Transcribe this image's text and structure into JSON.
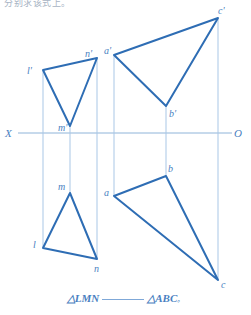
{
  "header": {
    "note": "分别求该式上。"
  },
  "axis": {
    "x_label": "X",
    "o_label": "O",
    "line_color": "#8fb4d9",
    "y": 133,
    "x_start": 18,
    "x_end": 232
  },
  "colors": {
    "stroke": "#2e6db4",
    "thin": "#a9c7e6",
    "label": "#4a7fc1",
    "background": "#ffffff"
  },
  "projectors": [
    {
      "name": "projector-l",
      "x": 43,
      "y1": 70,
      "y2": 248
    },
    {
      "name": "projector-m",
      "x": 70,
      "y1": 126,
      "y2": 193
    },
    {
      "name": "projector-n",
      "x": 97,
      "y1": 58,
      "y2": 259
    },
    {
      "name": "projector-a",
      "x": 114,
      "y1": 55,
      "y2": 196
    },
    {
      "name": "projector-b",
      "x": 166,
      "y1": 106,
      "y2": 176
    },
    {
      "name": "projector-c",
      "x": 218,
      "y1": 18,
      "y2": 280
    }
  ],
  "chart_data": {
    "type": "diagram",
    "triangles": [
      {
        "id": "lmn-front",
        "name": "l'm'n'",
        "points": [
          [
            43,
            70
          ],
          [
            70,
            126
          ],
          [
            97,
            58
          ]
        ],
        "labels": [
          {
            "text": "l'",
            "x": 27,
            "y": 74
          },
          {
            "text": "m'",
            "x": 58,
            "y": 131
          },
          {
            "text": "n'",
            "x": 85,
            "y": 57
          }
        ]
      },
      {
        "id": "lmn-top",
        "name": "lmn",
        "points": [
          [
            43,
            248
          ],
          [
            70,
            193
          ],
          [
            97,
            259
          ]
        ],
        "labels": [
          {
            "text": "l",
            "x": 33,
            "y": 248
          },
          {
            "text": "m",
            "x": 58,
            "y": 190
          },
          {
            "text": "n",
            "x": 94,
            "y": 272
          }
        ]
      },
      {
        "id": "abc-front",
        "name": "a'b'c'",
        "points": [
          [
            114,
            55
          ],
          [
            166,
            106
          ],
          [
            218,
            18
          ]
        ],
        "labels": [
          {
            "text": "a'",
            "x": 104,
            "y": 54
          },
          {
            "text": "b'",
            "x": 169,
            "y": 117
          },
          {
            "text": "c'",
            "x": 218,
            "y": 14
          }
        ]
      },
      {
        "id": "abc-top",
        "name": "abc",
        "points": [
          [
            114,
            196
          ],
          [
            166,
            176
          ],
          [
            218,
            280
          ]
        ],
        "labels": [
          {
            "text": "a",
            "x": 104,
            "y": 196
          },
          {
            "text": "b",
            "x": 168,
            "y": 172
          },
          {
            "text": "c",
            "x": 221,
            "y": 288
          }
        ]
      }
    ]
  },
  "caption": {
    "left_triangle": "△LMN",
    "right_triangle": "△ABC",
    "terminator": "。"
  }
}
